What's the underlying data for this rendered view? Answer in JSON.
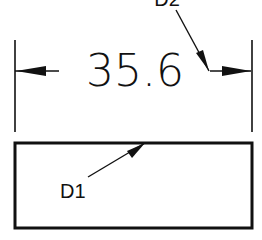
{
  "drawing": {
    "dimension_value": "35.6",
    "labels": {
      "d1": "D1",
      "d2": "D2"
    },
    "colors": {
      "line": "#111111",
      "background": "#ffffff"
    }
  }
}
